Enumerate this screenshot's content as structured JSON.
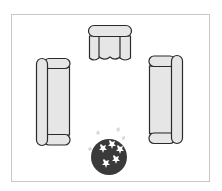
{
  "diagram": {
    "type": "furniture-floor-plan",
    "colors": {
      "background": "#ffffff",
      "room_border": "#c8c8c8",
      "furniture_fill": "#e6e6e6",
      "furniture_stroke": "#2a2a2a",
      "plant_fill": "#3a3a3a",
      "plant_leaves": "#ffffff"
    },
    "items": [
      {
        "id": "armchair-top",
        "kind": "armchair",
        "position": "top-center"
      },
      {
        "id": "sofa-left",
        "kind": "sofa",
        "position": "left",
        "orientation": "vertical"
      },
      {
        "id": "sofa-right",
        "kind": "sofa",
        "position": "right",
        "orientation": "vertical"
      },
      {
        "id": "plant-bottom",
        "kind": "potted-plant",
        "position": "bottom-center"
      }
    ]
  }
}
